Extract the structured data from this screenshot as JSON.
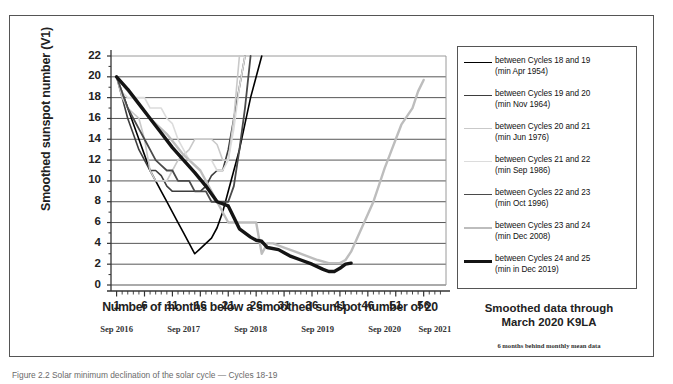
{
  "figure": {
    "caption": "Figure 2.2 Solar minimum declination of the solar cycle — Cycles 18-19"
  },
  "notes": {
    "main_line1": "Smoothed data through",
    "main_line2": "March 2020 K9LA",
    "sub": "6 months behind monthly mean data"
  },
  "year_axis": {
    "labels": [
      "Sep 2016",
      "Sep 2017",
      "Sep 2018",
      "Sep 2019",
      "Sep 2020",
      "Sep 2021"
    ],
    "x_positions": [
      1,
      13,
      25,
      37,
      49,
      58
    ]
  },
  "chart_data": {
    "type": "line",
    "title": "",
    "xlabel": "Number of months below a smoothed sunspot number of 20",
    "ylabel": "Smoothed sunspot number (V1)",
    "xlim": [
      0,
      60
    ],
    "ylim": [
      0,
      22
    ],
    "ytick_step": 2,
    "yticks": [
      0,
      2,
      4,
      6,
      8,
      10,
      12,
      14,
      16,
      18,
      20,
      22
    ],
    "xticks": [
      1,
      6,
      11,
      16,
      21,
      26,
      31,
      36,
      41,
      46,
      51,
      56
    ],
    "grid": "horizontal",
    "legend_position": "right-outside",
    "series": [
      {
        "name": "between Cycles 18 and 19",
        "sub": "(min Apr 1954)",
        "color": "#000000",
        "width": 1.6,
        "x": [
          1,
          2,
          3,
          4,
          5,
          6,
          7,
          8,
          9,
          10,
          11,
          12,
          13,
          14,
          15,
          16,
          17,
          18,
          19,
          20,
          21,
          22,
          23,
          24,
          25,
          26,
          27
        ],
        "y": [
          20,
          18.5,
          17,
          15.5,
          14,
          12.5,
          11,
          10,
          9,
          8,
          7,
          6,
          5,
          4,
          3,
          3.5,
          4,
          4.5,
          5.5,
          7,
          9,
          11,
          13,
          15.5,
          18,
          20,
          22
        ]
      },
      {
        "name": "between Cycles 19 and 20",
        "sub": "(min Nov 1964)",
        "color": "#3d3d3d",
        "width": 1.6,
        "x": [
          1,
          2,
          3,
          4,
          5,
          6,
          7,
          8,
          9,
          10,
          11,
          12,
          13,
          14,
          15,
          16,
          17,
          18,
          19,
          20,
          21,
          22,
          23,
          24
        ],
        "y": [
          20,
          18,
          16,
          14.5,
          13,
          12,
          11,
          11,
          10.5,
          9.5,
          9,
          9,
          9,
          9,
          9,
          9,
          9.5,
          10.5,
          11,
          11,
          13,
          16,
          19,
          22
        ]
      },
      {
        "name": "between Cycles 20 and 21",
        "sub": "(min Jun 1976)",
        "color": "#c9c9c9",
        "width": 1.6,
        "x": [
          1,
          2,
          3,
          4,
          5,
          6,
          7,
          8,
          9,
          10,
          11,
          12,
          13,
          14,
          15,
          16,
          17,
          18,
          19,
          20,
          21,
          22,
          23
        ],
        "y": [
          20,
          18,
          17,
          16.5,
          16,
          14,
          11,
          10,
          10,
          10,
          11,
          12,
          12.5,
          13,
          14,
          14,
          14,
          14,
          13.5,
          12,
          12,
          16,
          22
        ]
      },
      {
        "name": "between Cycles 21 and 22",
        "sub": "(min Sep 1986)",
        "color": "#dcdcdc",
        "width": 1.6,
        "x": [
          1,
          2,
          3,
          4,
          5,
          6,
          7,
          8,
          9,
          10,
          11,
          12,
          13,
          14,
          15,
          16,
          17,
          18,
          19,
          20,
          21,
          22,
          23,
          24
        ],
        "y": [
          20,
          18.5,
          18,
          18,
          18,
          18,
          17,
          17,
          17,
          16,
          15.5,
          14,
          13,
          12,
          12,
          12,
          12,
          12,
          11,
          11,
          12,
          15,
          19,
          22
        ]
      },
      {
        "name": "between Cycles 22 and 23",
        "sub": "(min Oct 1996)",
        "color": "#4a4a4a",
        "width": 1.8,
        "x": [
          1,
          2,
          3,
          4,
          5,
          6,
          7,
          8,
          9,
          10,
          11,
          12,
          13,
          14,
          15,
          16,
          17,
          18,
          19,
          20,
          21,
          22,
          23,
          24,
          25
        ],
        "y": [
          20,
          18.5,
          17,
          16,
          15,
          14,
          13,
          12,
          11.5,
          11,
          11,
          10,
          10,
          10,
          9,
          9,
          9,
          8,
          8,
          8,
          8,
          9.5,
          13,
          17,
          22
        ]
      },
      {
        "name": "between Cycles 23 and 24",
        "sub": "(min Dec 2008)",
        "color": "#bdbdbd",
        "width": 2.4,
        "x": [
          1,
          4,
          7,
          10,
          13,
          16,
          19,
          21,
          22,
          24,
          26,
          27,
          28,
          29,
          31,
          33,
          35,
          37,
          39,
          40,
          41,
          42,
          43,
          44,
          45,
          46,
          47,
          48,
          49,
          50,
          51,
          52,
          53,
          54,
          55,
          56
        ],
        "y": [
          20,
          18,
          16,
          14.5,
          12.5,
          11,
          8,
          6,
          6,
          6,
          6,
          3,
          4,
          4,
          3.6,
          3.2,
          2.8,
          2.4,
          2.1,
          2.1,
          2.1,
          2.4,
          3.2,
          4.4,
          5.6,
          6.8,
          8,
          9.6,
          11.2,
          12.6,
          14,
          15.4,
          16.2,
          17,
          18.6,
          19.7
        ]
      },
      {
        "name": "between Cycles 24 and 25",
        "sub": "(min in Dec 2019)",
        "color": "#141414",
        "width": 3.4,
        "x": [
          1,
          3,
          5,
          7,
          9,
          11,
          13,
          15,
          17,
          19,
          21,
          23,
          25,
          26,
          27,
          28,
          30,
          32,
          34,
          36,
          38,
          39,
          40,
          41,
          42,
          43
        ],
        "y": [
          20,
          18.8,
          17.4,
          16,
          14.6,
          13.2,
          12,
          10.8,
          9.5,
          8,
          7.6,
          5.4,
          4.6,
          4.3,
          4.2,
          3.6,
          3.4,
          2.8,
          2.4,
          2.0,
          1.5,
          1.3,
          1.3,
          1.6,
          2.0,
          2.1
        ]
      }
    ]
  }
}
